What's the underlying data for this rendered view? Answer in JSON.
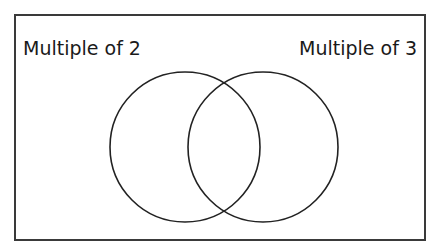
{
  "diagram": {
    "type": "venn",
    "sets": [
      {
        "label": "Multiple of 2",
        "cx": 185,
        "cy": 147,
        "r": 75
      },
      {
        "label": "Multiple of 3",
        "cx": 263,
        "cy": 147,
        "r": 75
      }
    ],
    "stroke_color": "#222222",
    "frame_color": "#3a3a3a"
  }
}
